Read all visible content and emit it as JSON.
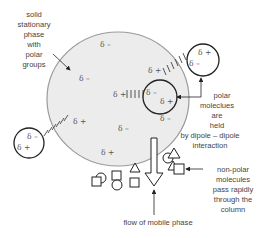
{
  "labels": {
    "stationary": [
      "solid",
      "stationary",
      "phase",
      "with",
      "polar",
      "groups"
    ],
    "polar": [
      "polar",
      "moleclues",
      "are",
      "held",
      "by dipole – dipole",
      "interaction"
    ],
    "nonpolar": [
      "non-polar",
      "molecules",
      "pass rapidly",
      "through the",
      "column"
    ],
    "flow": "flow of mobile phase"
  },
  "charges": {
    "positive": "δ +",
    "negative": "δ –"
  },
  "colors": {
    "stationary_fill": "#ececec",
    "stationary_stroke": "#9a9a9a",
    "line": "#333333",
    "text": "#444444"
  }
}
